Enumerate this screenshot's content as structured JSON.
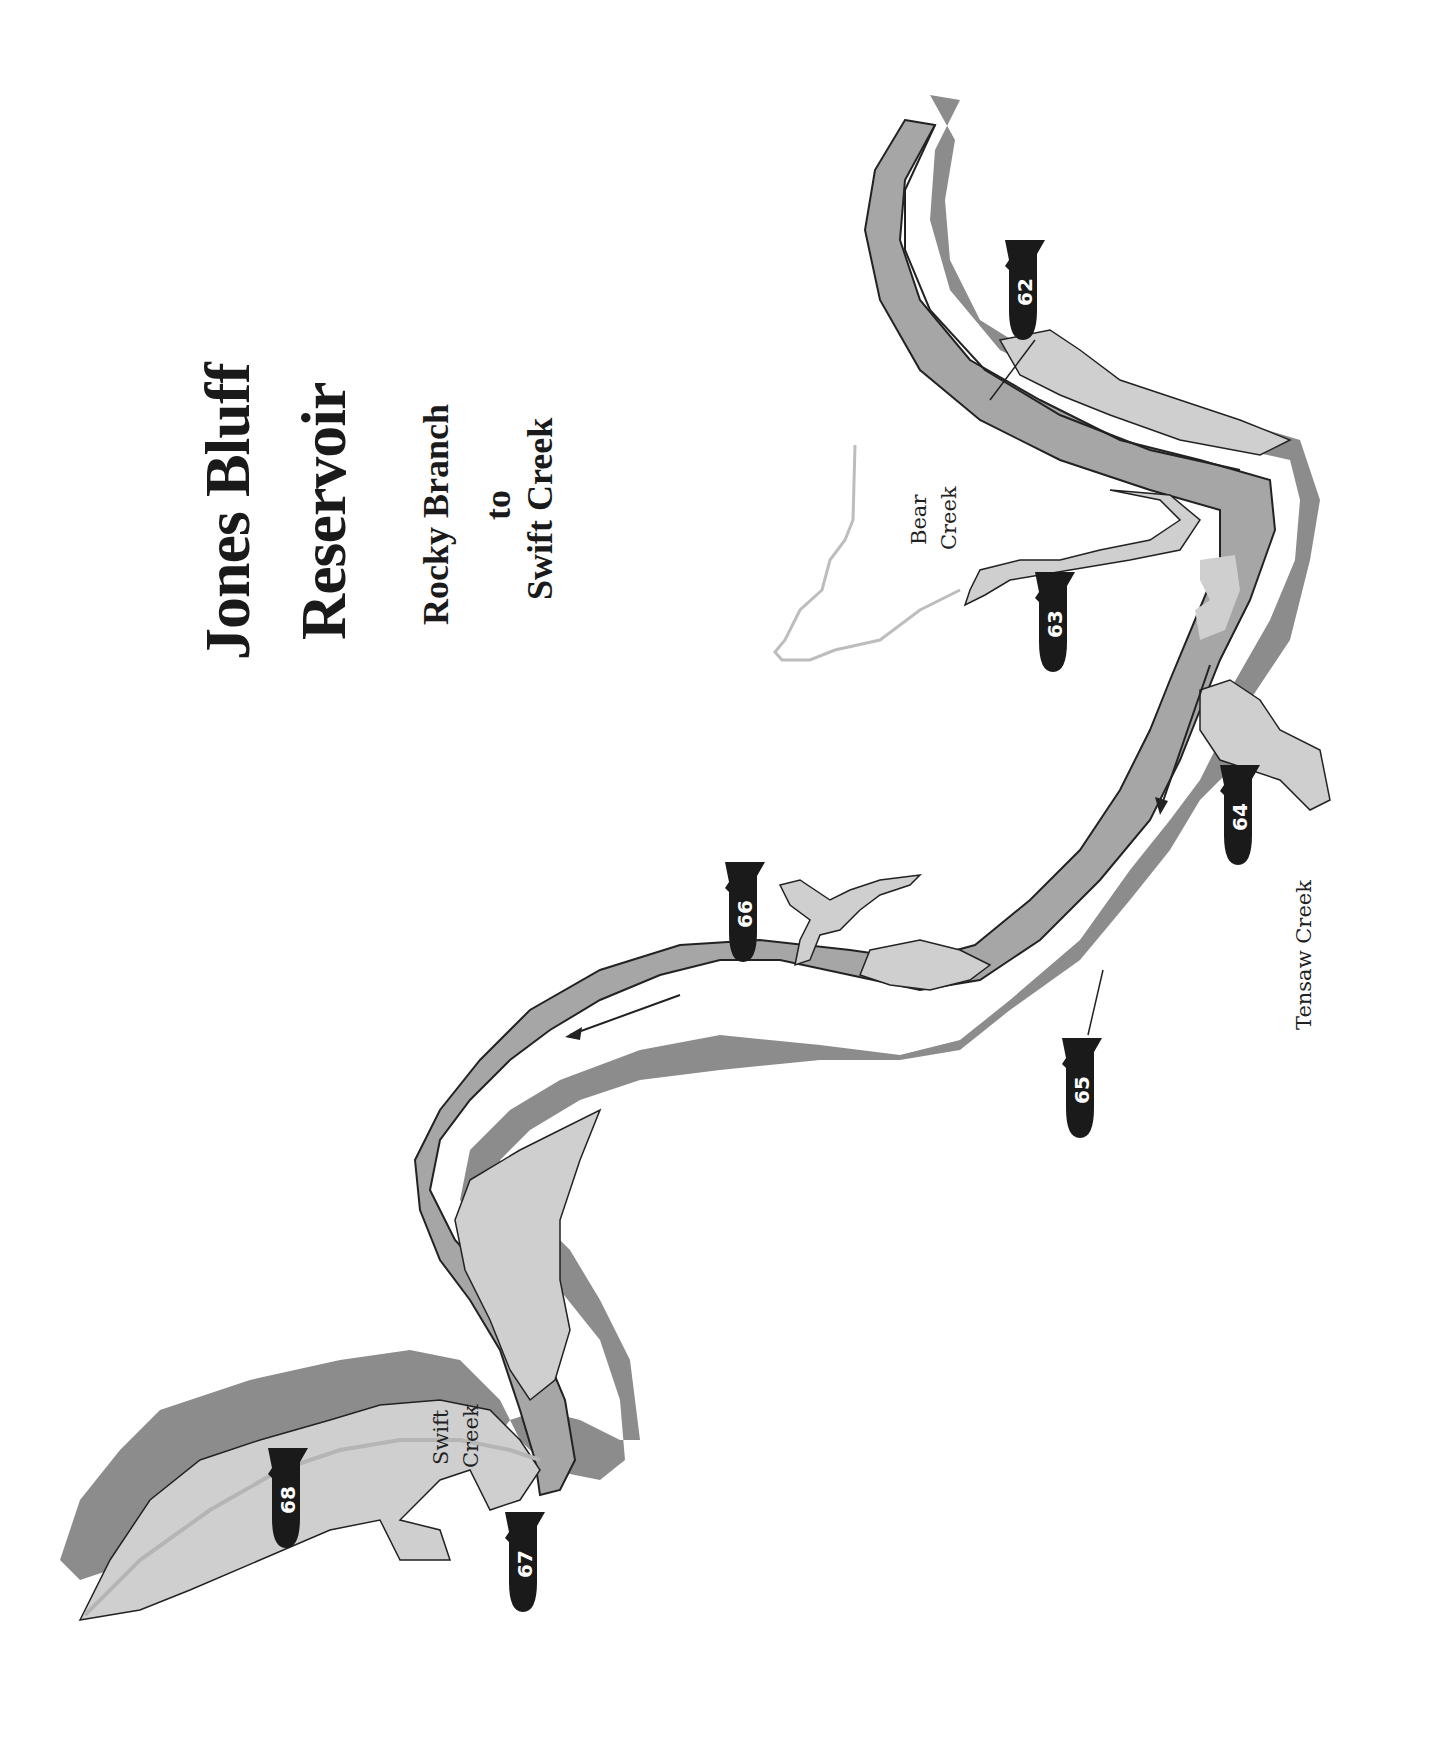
{
  "title": {
    "line1": "Jones Bluff",
    "line2": "Reservoir",
    "subtitle_line1": "Rocky Branch",
    "subtitle_line2": "to",
    "subtitle_line3": "Swift Creek"
  },
  "place_labels": {
    "bear_creek_1": "Bear",
    "bear_creek_2": "Creek",
    "tensaw_creek": "Tensaw Creek",
    "swift_creek_1": "Swift",
    "swift_creek_2": "Creek"
  },
  "fishing_spots": [
    {
      "id": "62",
      "label": "62"
    },
    {
      "id": "63",
      "label": "63"
    },
    {
      "id": "64",
      "label": "64"
    },
    {
      "id": "65",
      "label": "65"
    },
    {
      "id": "66",
      "label": "66"
    },
    {
      "id": "67",
      "label": "67"
    },
    {
      "id": "68",
      "label": "68"
    }
  ],
  "colors": {
    "background": "#ffffff",
    "channel": "#a6a6a6",
    "deep_shelf": "#8c8c8c",
    "shallow_flats": "#cfcfcf",
    "outline": "#222222",
    "marker": "#1a1a1a",
    "creek_line": "#bdbdbd"
  }
}
